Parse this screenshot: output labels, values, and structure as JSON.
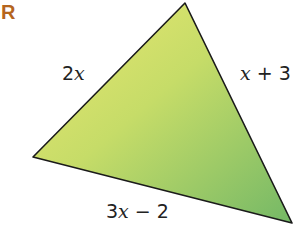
{
  "figure_label": "R",
  "colors": {
    "label_accent": "#b5651d",
    "fill_light": "#e3e36a",
    "fill_dark": "#7fbf6a",
    "stroke": "#1a1a1a"
  },
  "triangle": {
    "vertices": {
      "top": [
        185,
        3
      ],
      "left": [
        33,
        157
      ],
      "bottom_right": [
        292,
        223
      ]
    },
    "sides": {
      "left_side": {
        "var": "x",
        "prefix": "2",
        "suffix": "",
        "text": "2x"
      },
      "right_side": {
        "var": "x",
        "prefix": "",
        "suffix": " + 3",
        "text": "x + 3"
      },
      "bottom_side": {
        "var": "x",
        "prefix": "3",
        "suffix": " − 2",
        "text": "3x − 2"
      }
    }
  }
}
